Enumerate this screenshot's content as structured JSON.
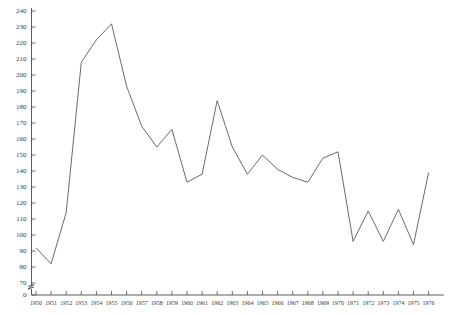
{
  "chart_data": {
    "type": "line",
    "title": "",
    "xlabel": "",
    "ylabel": "",
    "grid": false,
    "legend": "none",
    "axis_break": {
      "from": 0,
      "to": 70,
      "note": "y-axis broken between 0 and 70"
    },
    "xlim": [
      1950,
      1976
    ],
    "ylim": [
      70,
      240
    ],
    "ytick_values": [
      0,
      70,
      80,
      90,
      100,
      110,
      120,
      130,
      140,
      150,
      160,
      170,
      180,
      190,
      200,
      210,
      220,
      230,
      240
    ],
    "ytick_labels": [
      "0",
      "70",
      "80",
      "90",
      "100",
      "110",
      "120",
      "130",
      "140",
      "150",
      "160",
      "170",
      "180",
      "190",
      "200",
      "210",
      "220",
      "230",
      "240"
    ],
    "x": [
      1950,
      1951,
      1952,
      1953,
      1954,
      1955,
      1956,
      1957,
      1958,
      1959,
      1960,
      1961,
      1962,
      1963,
      1964,
      1965,
      1966,
      1967,
      1968,
      1969,
      1970,
      1971,
      1972,
      1973,
      1974,
      1975,
      1976
    ],
    "xtick_labels": [
      "1950",
      "1951",
      "1952",
      "1953",
      "1954",
      "1955",
      "1956",
      "1957",
      "1958",
      "1959",
      "1960",
      "1961",
      "1962",
      "1963",
      "1964",
      "1965",
      "1966",
      "1967",
      "1968",
      "1969",
      "1970",
      "1971",
      "1972",
      "1973",
      "1974",
      "1975",
      "1976"
    ],
    "series": [
      {
        "name": "series-1",
        "color": "#5a5a5a",
        "values": [
          92,
          82,
          114,
          208,
          222,
          232,
          193,
          168,
          155,
          166,
          133,
          138,
          184,
          155,
          138,
          150,
          141,
          136,
          133,
          148,
          152,
          96,
          115,
          96,
          116,
          94,
          139
        ]
      }
    ]
  },
  "axis": {
    "y_color": "#4a4a4a",
    "x_color": "#4a4a4a"
  }
}
